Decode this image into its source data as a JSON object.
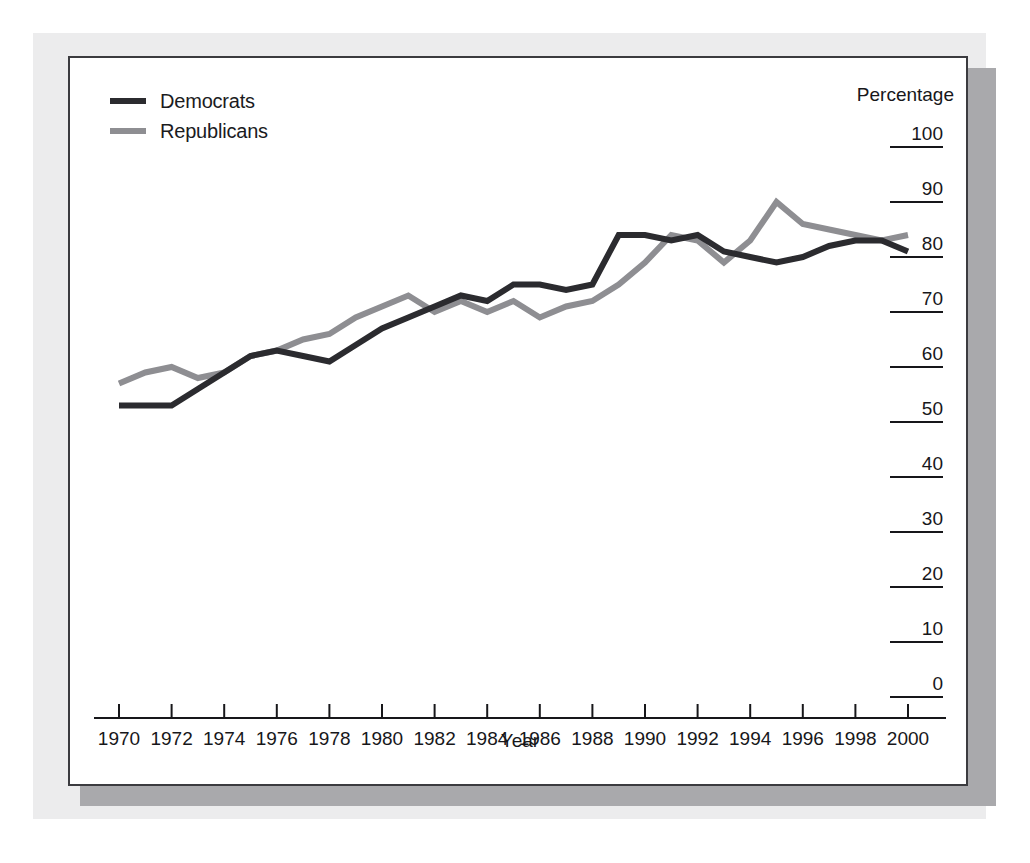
{
  "chart_data": {
    "type": "line",
    "title": "",
    "xlabel": "Year",
    "ylabel": "Percentage",
    "xlim": [
      1970,
      2000
    ],
    "ylim": [
      0,
      100
    ],
    "grid": false,
    "legend_position": "top-left",
    "xticks": [
      1970,
      1972,
      1974,
      1976,
      1978,
      1980,
      1982,
      1984,
      1986,
      1988,
      1990,
      1992,
      1994,
      1996,
      1998,
      2000
    ],
    "yticks": [
      0,
      10,
      20,
      30,
      40,
      50,
      60,
      70,
      80,
      90,
      100
    ],
    "x": [
      1970,
      1971,
      1972,
      1973,
      1974,
      1975,
      1976,
      1977,
      1978,
      1979,
      1980,
      1981,
      1982,
      1983,
      1984,
      1985,
      1986,
      1987,
      1988,
      1989,
      1990,
      1991,
      1992,
      1993,
      1994,
      1995,
      1996,
      1997,
      1998,
      1999,
      2000
    ],
    "series": [
      {
        "name": "Democrats",
        "color": "#2b2b2f",
        "values": [
          53,
          53,
          53,
          56,
          59,
          62,
          63,
          62,
          61,
          64,
          67,
          69,
          71,
          73,
          72,
          75,
          75,
          74,
          75,
          84,
          84,
          83,
          84,
          81,
          80,
          79,
          80,
          82,
          83,
          83,
          81
        ]
      },
      {
        "name": "Republicans",
        "color": "#8e8e92",
        "values": [
          57,
          59,
          60,
          58,
          59,
          62,
          63,
          65,
          66,
          69,
          71,
          73,
          70,
          72,
          70,
          72,
          69,
          71,
          72,
          75,
          79,
          84,
          83,
          79,
          83,
          90,
          86,
          85,
          84,
          83,
          84
        ]
      }
    ]
  },
  "legend": {
    "items": [
      {
        "label": "Democrats",
        "color": "#2b2b2f"
      },
      {
        "label": "Republicans",
        "color": "#8e8e92"
      }
    ]
  },
  "axes": {
    "y_title": "Percentage",
    "x_title": "Year"
  }
}
